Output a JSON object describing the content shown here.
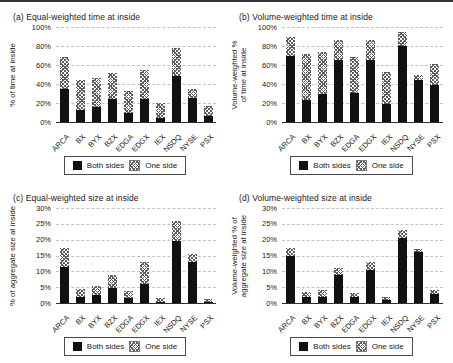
{
  "legend": {
    "both_label": "Both sides",
    "one_label": "One side"
  },
  "colors": {
    "both_sides": "#111111",
    "one_side_hatch": "#5d5d5d",
    "gridline": "#c2c2c2",
    "axis_baseline": "#2e2e2e",
    "top_rule": "#333333"
  },
  "chart_data": [
    {
      "type": "bar",
      "stacked": true,
      "title": "(a) Equal-weighted time at inside",
      "ylabel": "% of time at inside",
      "ylim": [
        0,
        100
      ],
      "ytick_step": 20,
      "ytick_suffix": "%",
      "grid": true,
      "legend_position": "bottom",
      "categories": [
        "ARCA",
        "BX",
        "BYX",
        "BZX",
        "EDGA",
        "EDGX",
        "IEX",
        "NSDQ",
        "NYSE",
        "PSX"
      ],
      "series": [
        {
          "name": "Both sides",
          "values": [
            35,
            13,
            16,
            24,
            10,
            24,
            4,
            48,
            25,
            6
          ]
        },
        {
          "name": "One side",
          "values": [
            33,
            31,
            30,
            28,
            23,
            31,
            16,
            30,
            10,
            11
          ]
        }
      ]
    },
    {
      "type": "bar",
      "stacked": true,
      "title": "(b) Volume-weighted time at inside",
      "ylabel": "Volume-weighted %\nof time at inside",
      "ylim": [
        0,
        100
      ],
      "ytick_step": 20,
      "ytick_suffix": "%",
      "grid": true,
      "legend_position": "bottom",
      "categories": [
        "ARCA",
        "BX",
        "BYX",
        "BZX",
        "EDGA",
        "EDGX",
        "IEX",
        "NSDQ",
        "NYSE",
        "PSX"
      ],
      "series": [
        {
          "name": "Both sides",
          "values": [
            70,
            23,
            30,
            65,
            31,
            65,
            19,
            80,
            44,
            39
          ]
        },
        {
          "name": "One side",
          "values": [
            20,
            49,
            44,
            21,
            37,
            21,
            34,
            15,
            6,
            22
          ]
        }
      ]
    },
    {
      "type": "bar",
      "stacked": true,
      "title": "(c) Equal-weighted size at inside",
      "ylabel": "% of aggregate size at inside",
      "ylim": [
        0,
        30
      ],
      "ytick_step": 5,
      "ytick_suffix": "%",
      "grid": true,
      "legend_position": "bottom",
      "categories": [
        "ARCA",
        "BX",
        "BYX",
        "BZX",
        "EDGA",
        "EDGX",
        "IEX",
        "NSDQ",
        "NYSE",
        "PSX"
      ],
      "series": [
        {
          "name": "Both sides",
          "values": [
            11.5,
            2,
            2.5,
            4.8,
            1.5,
            6,
            0.3,
            19.5,
            13,
            0.3
          ]
        },
        {
          "name": "One side",
          "values": [
            6,
            2.5,
            3,
            4,
            2.3,
            7,
            1.2,
            6.5,
            2.5,
            1
          ]
        }
      ]
    },
    {
      "type": "bar",
      "stacked": true,
      "title": "(d) Volume-weighted size at inside",
      "ylabel": "Volume-weighted % of\naggregate size at inside",
      "ylim": [
        0,
        30
      ],
      "ytick_step": 5,
      "ytick_suffix": "%",
      "grid": true,
      "legend_position": "bottom",
      "categories": [
        "ARCA",
        "BX",
        "BYX",
        "BZX",
        "EDGA",
        "EDGX",
        "IEX",
        "NSDQ",
        "NYSE",
        "PSX"
      ],
      "series": [
        {
          "name": "Both sides",
          "values": [
            15,
            1.8,
            2,
            9,
            1.8,
            10.5,
            1,
            20.5,
            16,
            2.8
          ]
        },
        {
          "name": "One side",
          "values": [
            2.5,
            1.7,
            2.2,
            2,
            1.4,
            2.5,
            1,
            2.5,
            1,
            1.2
          ]
        }
      ]
    }
  ]
}
